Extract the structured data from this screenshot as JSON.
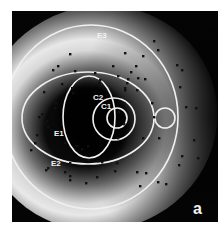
{
  "figure": {
    "panel_label": "a",
    "frame": {
      "x": 12,
      "y": 11,
      "width": 206,
      "height": 211
    },
    "background": "#ffffff",
    "map_colors": {
      "dark": "#050505",
      "bright": "#e6e6e6",
      "outline": "#f0f0f0",
      "dot": "#111111"
    }
  },
  "contours": {
    "E3": {
      "label": "E3",
      "shape": "ellipse",
      "cx": 91,
      "cy": 117,
      "rx": 87,
      "ry": 92,
      "label_x": 97,
      "label_y": 38
    },
    "E2": {
      "label": "E2",
      "shape": "ellipse",
      "cx": 88,
      "cy": 118,
      "rx": 66,
      "ry": 46,
      "label_x": 51,
      "label_y": 166
    },
    "E1": {
      "label": "E1",
      "shape": "ellipse",
      "cx": 89,
      "cy": 117,
      "rx": 26,
      "ry": 41,
      "label_x": 54,
      "label_y": 136
    },
    "C2": {
      "label": "C2",
      "shape": "circle",
      "cx": 114,
      "cy": 119,
      "r": 21,
      "label_x": 93,
      "label_y": 100
    },
    "C1": {
      "label": "C1",
      "shape": "circle",
      "cx": 117,
      "cy": 118,
      "r": 10,
      "label_x": 101,
      "label_y": 109
    },
    "small_circle": {
      "label": "",
      "shape": "circle",
      "cx": 165,
      "cy": 118,
      "r": 10
    }
  },
  "points": [
    [
      70,
      54
    ],
    [
      58,
      66
    ],
    [
      53,
      70
    ],
    [
      75,
      71
    ],
    [
      62,
      84
    ],
    [
      95,
      73
    ],
    [
      100,
      80
    ],
    [
      99,
      83
    ],
    [
      44,
      92
    ],
    [
      72,
      88
    ],
    [
      73,
      93
    ],
    [
      92,
      85
    ],
    [
      154,
      41
    ],
    [
      158,
      50
    ],
    [
      125,
      53
    ],
    [
      143,
      56
    ],
    [
      113,
      66
    ],
    [
      136,
      66
    ],
    [
      131,
      72
    ],
    [
      118,
      76
    ],
    [
      138,
      78
    ],
    [
      145,
      79
    ],
    [
      128,
      79
    ],
    [
      127,
      83
    ],
    [
      125,
      88
    ],
    [
      137,
      90
    ],
    [
      177,
      65
    ],
    [
      182,
      70
    ],
    [
      180,
      87
    ],
    [
      186,
      107
    ],
    [
      196,
      108
    ],
    [
      125,
      90
    ],
    [
      56,
      103
    ],
    [
      55,
      108
    ],
    [
      42,
      114
    ],
    [
      39,
      117
    ],
    [
      47,
      121
    ],
    [
      45,
      124
    ],
    [
      37,
      135
    ],
    [
      35,
      143
    ],
    [
      48,
      127
    ],
    [
      31,
      150
    ],
    [
      65,
      143
    ],
    [
      77,
      146
    ],
    [
      88,
      146
    ],
    [
      82,
      149
    ],
    [
      89,
      160
    ],
    [
      98,
      161
    ],
    [
      102,
      162
    ],
    [
      48,
      168
    ],
    [
      46,
      170
    ],
    [
      70,
      163
    ],
    [
      65,
      172
    ],
    [
      70,
      176
    ],
    [
      70,
      180
    ],
    [
      86,
      183
    ],
    [
      97,
      177
    ],
    [
      70,
      165
    ],
    [
      124,
      103
    ],
    [
      152,
      103
    ],
    [
      119,
      112
    ],
    [
      154,
      117
    ],
    [
      124,
      124
    ],
    [
      118,
      138
    ],
    [
      143,
      138
    ],
    [
      159,
      138
    ],
    [
      194,
      140
    ],
    [
      182,
      156
    ],
    [
      198,
      158
    ],
    [
      179,
      165
    ],
    [
      117,
      163
    ],
    [
      115,
      171
    ],
    [
      137,
      172
    ],
    [
      146,
      173
    ],
    [
      140,
      186
    ],
    [
      158,
      182
    ],
    [
      166,
      184
    ]
  ]
}
